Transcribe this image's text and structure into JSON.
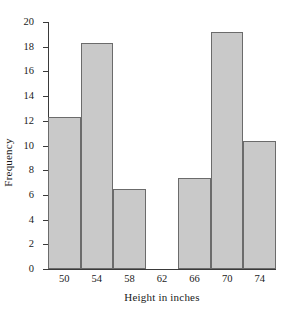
{
  "chart_data": {
    "type": "bar",
    "title": "",
    "subtitle": "",
    "xlabel": "Height in inches",
    "ylabel": "Frequency",
    "categories": [
      "50",
      "54",
      "58",
      "62",
      "66",
      "70",
      "74"
    ],
    "values": [
      12.3,
      18.3,
      6.5,
      0,
      7.4,
      19.2,
      10.4
    ],
    "series": [
      {
        "name": "Frequency",
        "values": [
          12.3,
          18.3,
          6.5,
          0,
          7.4,
          19.2,
          10.4
        ]
      }
    ],
    "bin_width": 4,
    "xlim": [
      48,
      76
    ],
    "ylim": [
      0,
      20
    ],
    "ytick_labels": [
      "0",
      "2",
      "4",
      "6",
      "8",
      "10",
      "12",
      "14",
      "16",
      "18",
      "20"
    ],
    "ytick_values": [
      0,
      2,
      4,
      6,
      8,
      10,
      12,
      14,
      16,
      18,
      20
    ],
    "xtick_labels": [
      "50",
      "54",
      "58",
      "62",
      "66",
      "70",
      "74"
    ],
    "grid": false,
    "legend": false,
    "legend_position": "none",
    "bar_fill_color": "#c9c9c9",
    "bar_edge_color": "#6b6b6b",
    "axis_color": "#3a3a3a",
    "background_color": "#ffffff"
  }
}
